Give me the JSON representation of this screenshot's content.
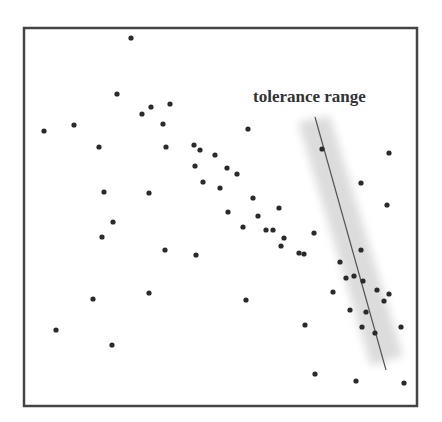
{
  "diagram": {
    "label": "tolerance range",
    "colors": {
      "frame": "#444444",
      "point": "#2a2a2a",
      "line": "#555555",
      "band": "#dcdcdc",
      "label": "#333333"
    },
    "frame": {
      "x": 24,
      "y": 28,
      "w": 393,
      "h": 378
    },
    "line": {
      "x1": 315,
      "y1": 117,
      "x2": 386,
      "y2": 370
    },
    "band": [
      [
        298,
        122
      ],
      [
        330,
        116
      ],
      [
        403,
        356
      ],
      [
        371,
        366
      ]
    ],
    "label_pos": {
      "x": 253,
      "y": 102
    },
    "points": [
      [
        131,
        38
      ],
      [
        117,
        94
      ],
      [
        142,
        114
      ],
      [
        151,
        107
      ],
      [
        170,
        104
      ],
      [
        163,
        124
      ],
      [
        44,
        131
      ],
      [
        74,
        125
      ],
      [
        99,
        147
      ],
      [
        166,
        147
      ],
      [
        194,
        145
      ],
      [
        200,
        150
      ],
      [
        215,
        155
      ],
      [
        195,
        166
      ],
      [
        227,
        168
      ],
      [
        237,
        174
      ],
      [
        203,
        182
      ],
      [
        220,
        188
      ],
      [
        104,
        192
      ],
      [
        149,
        193
      ],
      [
        253,
        198
      ],
      [
        279,
        208
      ],
      [
        228,
        212
      ],
      [
        258,
        216
      ],
      [
        113,
        222
      ],
      [
        243,
        227
      ],
      [
        266,
        230
      ],
      [
        273,
        230
      ],
      [
        284,
        238
      ],
      [
        281,
        246
      ],
      [
        102,
        237
      ],
      [
        165,
        250
      ],
      [
        196,
        255
      ],
      [
        299,
        253
      ],
      [
        304,
        254
      ],
      [
        314,
        233
      ],
      [
        248,
        129
      ],
      [
        322,
        149
      ],
      [
        389,
        153
      ],
      [
        361,
        183
      ],
      [
        387,
        205
      ],
      [
        361,
        250
      ],
      [
        340,
        262
      ],
      [
        346,
        278
      ],
      [
        354,
        276
      ],
      [
        363,
        281
      ],
      [
        333,
        292
      ],
      [
        377,
        290
      ],
      [
        384,
        301
      ],
      [
        389,
        294
      ],
      [
        350,
        310
      ],
      [
        366,
        312
      ],
      [
        362,
        327
      ],
      [
        375,
        333
      ],
      [
        401,
        327
      ],
      [
        149,
        293
      ],
      [
        93,
        299
      ],
      [
        246,
        300
      ],
      [
        305,
        325
      ],
      [
        56,
        330
      ],
      [
        112,
        345
      ],
      [
        315,
        374
      ],
      [
        356,
        381
      ],
      [
        404,
        383
      ]
    ]
  }
}
